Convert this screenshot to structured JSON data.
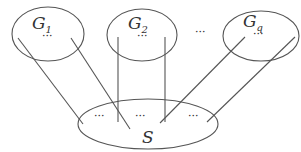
{
  "diagram": {
    "colors": {
      "stroke": "#555555",
      "text": "#333333",
      "background": "#ffffff"
    },
    "groups": [
      {
        "id": "G1",
        "label": "G",
        "subscript": "1",
        "inner_dots": "···"
      },
      {
        "id": "G2",
        "label": "G",
        "subscript": "2",
        "inner_dots": "···"
      },
      {
        "id": "Gq",
        "label": "G",
        "subscript": "q",
        "inner_dots": "···"
      }
    ],
    "between_groups_dots": "···",
    "separator": {
      "id": "S",
      "label": "S",
      "inner_dots": [
        "···",
        "···",
        "···"
      ]
    },
    "edges": [
      {
        "from": "G1",
        "to": "S"
      },
      {
        "from": "G1",
        "to": "S"
      },
      {
        "from": "G2",
        "to": "S"
      },
      {
        "from": "G2",
        "to": "S"
      },
      {
        "from": "Gq",
        "to": "S"
      },
      {
        "from": "Gq",
        "to": "S"
      }
    ]
  }
}
